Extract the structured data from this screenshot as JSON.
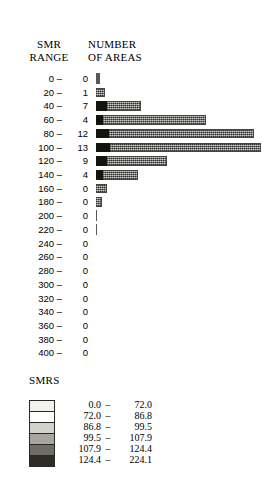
{
  "header": {
    "range_label": "SMR\nRANGE",
    "count_label": "NUMBER\nOF AREAS"
  },
  "legend": {
    "title": "SMRS",
    "dash": "–",
    "entries": [
      {
        "low": "0.0",
        "high": "72.0",
        "color": "#f2f1ee"
      },
      {
        "low": "72.0",
        "high": "86.8",
        "color": "#ffffff"
      },
      {
        "low": "86.8",
        "high": "99.5",
        "color": "#d3d1cc"
      },
      {
        "low": "99.5",
        "high": "107.9",
        "color": "#a8a6a1"
      },
      {
        "low": "107.9",
        "high": "124.4",
        "color": "#6e6c67"
      },
      {
        "low": "124.4",
        "high": "224.1",
        "color": "#2e2c28"
      }
    ]
  },
  "chart_data": {
    "type": "bar",
    "orientation": "horizontal",
    "title": "",
    "xlabel": "NUMBER OF AREAS",
    "ylabel": "SMR RANGE",
    "grid": false,
    "legend_position": "bottom",
    "xlim": [
      0,
      13
    ],
    "categories": [
      "0 –",
      "20 –",
      "40 –",
      "60 –",
      "80 –",
      "100 –",
      "120 –",
      "140 –",
      "160 –",
      "180 –",
      "200 –",
      "220 –",
      "240 –",
      "260 –",
      "280 –",
      "300 –",
      "320 –",
      "340 –",
      "360 –",
      "380 –",
      "400 –"
    ],
    "values": [
      0,
      1,
      7,
      4,
      12,
      13,
      9,
      4,
      0,
      0,
      0,
      0,
      0,
      0,
      0,
      0,
      0,
      0,
      0,
      0,
      0
    ],
    "bars": [
      {
        "range": "0 –",
        "count": "0",
        "px_width": 4,
        "dark_px": 0,
        "tick": true
      },
      {
        "range": "20 –",
        "count": "1",
        "px_width": 9,
        "dark_px": 0,
        "tick": false
      },
      {
        "range": "40 –",
        "count": "7",
        "px_width": 45,
        "dark_px": 11,
        "tick": false
      },
      {
        "range": "60 –",
        "count": "4",
        "px_width": 110,
        "dark_px": 7,
        "tick": false
      },
      {
        "range": "80 –",
        "count": "12",
        "px_width": 158,
        "dark_px": 13,
        "tick": false
      },
      {
        "range": "100 –",
        "count": "13",
        "px_width": 165,
        "dark_px": 14,
        "tick": false
      },
      {
        "range": "120 –",
        "count": "9",
        "px_width": 71,
        "dark_px": 11,
        "tick": false
      },
      {
        "range": "140 –",
        "count": "4",
        "px_width": 42,
        "dark_px": 7,
        "tick": false
      },
      {
        "range": "160 –",
        "count": "0",
        "px_width": 11,
        "dark_px": 0,
        "tick": false
      },
      {
        "range": "180 –",
        "count": "0",
        "px_width": 6,
        "dark_px": 0,
        "tick": false
      },
      {
        "range": "200 –",
        "count": "0",
        "px_width": 1,
        "dark_px": 0,
        "tick": true
      },
      {
        "range": "220 –",
        "count": "0",
        "px_width": 1,
        "dark_px": 0,
        "tick": true
      },
      {
        "range": "240 –",
        "count": "0",
        "px_width": 0,
        "dark_px": 0,
        "tick": false
      },
      {
        "range": "260 –",
        "count": "0",
        "px_width": 0,
        "dark_px": 0,
        "tick": false
      },
      {
        "range": "280 –",
        "count": "0",
        "px_width": 0,
        "dark_px": 0,
        "tick": false
      },
      {
        "range": "300 –",
        "count": "0",
        "px_width": 0,
        "dark_px": 0,
        "tick": false
      },
      {
        "range": "320 –",
        "count": "0",
        "px_width": 0,
        "dark_px": 0,
        "tick": false
      },
      {
        "range": "340 –",
        "count": "0",
        "px_width": 0,
        "dark_px": 0,
        "tick": false
      },
      {
        "range": "360 –",
        "count": "0",
        "px_width": 0,
        "dark_px": 0,
        "tick": false
      },
      {
        "range": "380 –",
        "count": "0",
        "px_width": 0,
        "dark_px": 0,
        "tick": false
      },
      {
        "range": "400 –",
        "count": "0",
        "px_width": 0,
        "dark_px": 0,
        "tick": false
      }
    ]
  }
}
